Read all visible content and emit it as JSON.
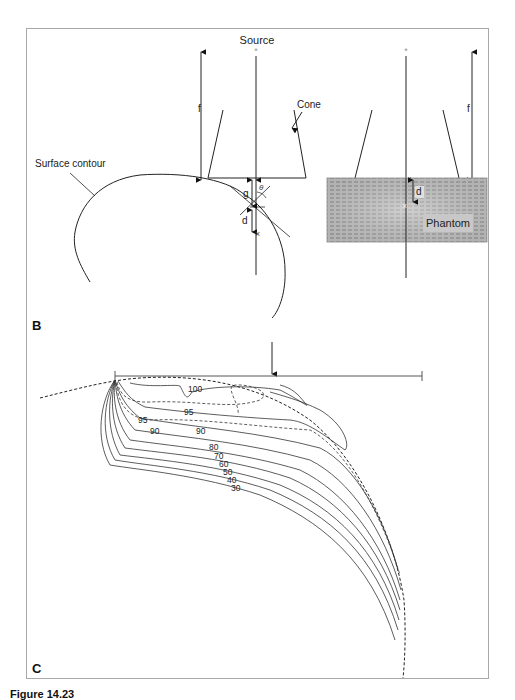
{
  "figure": {
    "panels": [
      {
        "letter": "B",
        "labels": {
          "source": "Source",
          "cone": "Cone",
          "surface_contour": "Surface contour",
          "f_left": "f",
          "f_right": "f",
          "g": "g",
          "d_left": "d",
          "d_right": "d",
          "theta": "θ",
          "phantom": "Phantom",
          "cross_left": "×",
          "cross_right": "×"
        }
      },
      {
        "letter": "C",
        "isodose_labels": [
          "100",
          "95",
          "95",
          "90",
          "90",
          "80",
          "70",
          "60",
          "50",
          "40",
          "30"
        ]
      }
    ],
    "caption": "Figure 14.23"
  },
  "colors": {
    "frame": "#a8a8a8",
    "line": "#222222",
    "phantom_fill": "#b8b8b8",
    "phantom_label_bg": "#d0d0d0"
  }
}
